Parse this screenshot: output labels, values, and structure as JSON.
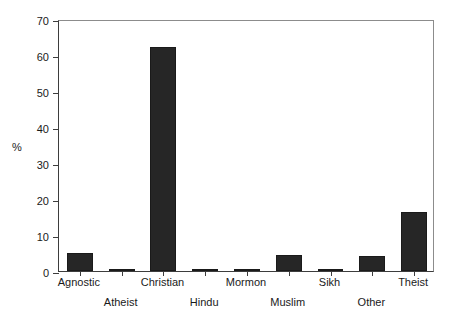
{
  "chart_data": {
    "type": "bar",
    "title": "",
    "subtitle": "",
    "xlabel": "",
    "ylabel": "%",
    "categories": [
      "Agnostic",
      "Atheist",
      "Christian",
      "Hindu",
      "Mormon",
      "Muslim",
      "Sikh",
      "Other",
      "Theist"
    ],
    "values": [
      5.0,
      0.5,
      62.2,
      0.5,
      0.5,
      4.5,
      0.5,
      4.3,
      16.3
    ],
    "ylim": [
      0,
      70
    ],
    "yticks": [
      0,
      10,
      20,
      30,
      40,
      50,
      60,
      70
    ],
    "ytick_labels": [
      "0",
      "10",
      "20",
      "30",
      "40",
      "50",
      "60",
      "70"
    ],
    "grid": false,
    "legend": null,
    "bar_color": "#262626",
    "axis_color": "#3d3d3d",
    "frame_color": "#8c8c8c",
    "background": "#ffffff",
    "label_rows": [
      0,
      1,
      0,
      1,
      0,
      1,
      0,
      1,
      0
    ]
  }
}
